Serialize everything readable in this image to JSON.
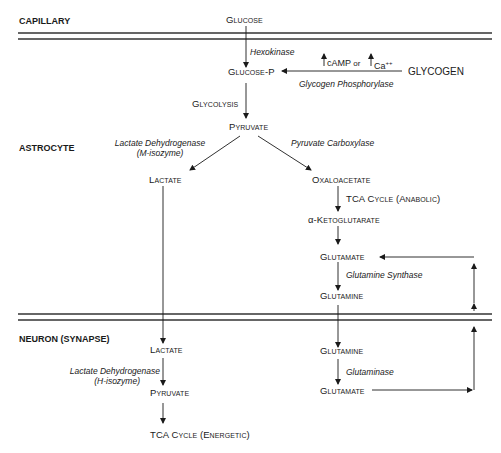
{
  "regions": {
    "capillary": "CAPILLARY",
    "astrocyte": "ASTROCYTE",
    "neuron": "NEURON (SYNAPSE)"
  },
  "metabolites": {
    "glucose": "Glucose",
    "glucose_p": "Glucose-P",
    "glycogen": "GLYCOGEN",
    "pyruvate_astro": "Pyruvate",
    "lactate_astro": "Lactate",
    "oxaloacetate": "Oxaloacetate",
    "alpha_kg_prefix": "α-",
    "alpha_kg": "Ketoglutarate",
    "glutamate_astro": "Glutamate",
    "glutamine_astro": "Glutamine",
    "lactate_neuron": "Lactate",
    "pyruvate_neuron": "Pyruvate",
    "glutamine_neuron": "Glutamine",
    "glutamate_neuron": "Glutamate"
  },
  "processes": {
    "glycolysis": "Glycolysis",
    "tca_anabolic": "TCA Cycle (Anabolic)",
    "tca_energetic": "TCA Cycle (Energetic)"
  },
  "enzymes": {
    "hexokinase": "Hexokinase",
    "glycogen_phosphorylase": "Glycogen Phosphorylase",
    "ldh_m_line1": "Lactate Dehydrogenase",
    "ldh_m_line2": "(M-isozyme)",
    "pyruvate_carboxylase": "Pyruvate Carboxylase",
    "glutamine_synthase": "Glutamine Synthase",
    "ldh_h_line1": "Lactate Dehydrogenase",
    "ldh_h_line2": "(H-isozyme)",
    "glutaminase": "Glutaminase"
  },
  "regulators": {
    "camp": "cAMP",
    "or": "or",
    "ca": "Ca",
    "ca_charge": "++"
  },
  "colors": {
    "line": "#1a1a1a",
    "membrane": "#333333",
    "background": "#ffffff"
  }
}
